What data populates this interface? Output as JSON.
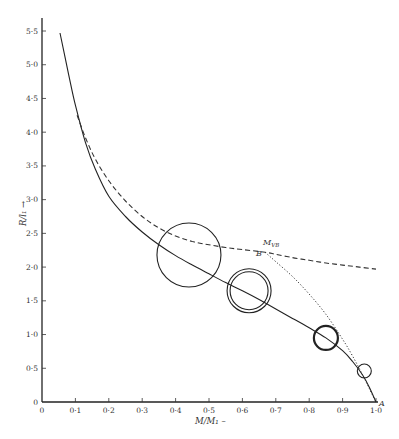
{
  "chart_data": {
    "type": "line",
    "title": "",
    "xlabel": "M/M₁ →",
    "ylabel": "R/l₁ →",
    "xlim": [
      0,
      1.0
    ],
    "ylim": [
      0,
      5.5
    ],
    "grid": false,
    "legend": null,
    "x_ticks": [
      "0",
      "0·1",
      "0·2",
      "0·3",
      "0·4",
      "0·5",
      "0·6",
      "0·7",
      "0·8",
      "0·9",
      "1·0"
    ],
    "y_ticks": [
      "0",
      "0·5",
      "1·0",
      "1·5",
      "2·0",
      "2·5",
      "3·0",
      "3·5",
      "4·0",
      "4·5",
      "5·0",
      "5·5"
    ],
    "series": [
      {
        "name": "solid curve",
        "style": "solid",
        "x": [
          0.054,
          0.08,
          0.1,
          0.13,
          0.16,
          0.2,
          0.25,
          0.3,
          0.35,
          0.4,
          0.45,
          0.5,
          0.55,
          0.6,
          0.65,
          0.7,
          0.75,
          0.8,
          0.85,
          0.9,
          0.93,
          0.96,
          0.98,
          1.0
        ],
        "y": [
          5.47,
          4.85,
          4.4,
          3.85,
          3.45,
          3.05,
          2.75,
          2.52,
          2.33,
          2.17,
          2.03,
          1.9,
          1.77,
          1.65,
          1.52,
          1.38,
          1.24,
          1.1,
          0.95,
          0.76,
          0.6,
          0.4,
          0.22,
          0.0
        ]
      },
      {
        "name": "dashed curve",
        "style": "dashed",
        "x": [
          0.105,
          0.13,
          0.16,
          0.2,
          0.25,
          0.3,
          0.35,
          0.4,
          0.45,
          0.5,
          0.55,
          0.6,
          0.668,
          0.7,
          0.75,
          0.8,
          0.85,
          0.9,
          0.95,
          1.0
        ],
        "y": [
          4.25,
          3.92,
          3.6,
          3.28,
          2.98,
          2.75,
          2.58,
          2.46,
          2.38,
          2.33,
          2.29,
          2.26,
          2.22,
          2.19,
          2.14,
          2.1,
          2.06,
          2.03,
          2.0,
          1.97
        ]
      },
      {
        "name": "dotted curve",
        "style": "dotted",
        "x": [
          0.668,
          0.7,
          0.75,
          0.8,
          0.85,
          0.9,
          0.93,
          0.96,
          0.98,
          1.0
        ],
        "y": [
          2.22,
          2.08,
          1.86,
          1.6,
          1.3,
          0.93,
          0.68,
          0.4,
          0.2,
          0.0
        ]
      }
    ],
    "circles": [
      {
        "cx": 0.44,
        "cy": 2.18,
        "r_px": 32,
        "style": "single-thin"
      },
      {
        "cx": 0.62,
        "cy": 1.65,
        "r_px": 22,
        "r_inner_px": 19,
        "style": "double"
      },
      {
        "cx": 0.85,
        "cy": 0.95,
        "r_px": 12,
        "style": "single-thick"
      },
      {
        "cx": 0.965,
        "cy": 0.46,
        "r_px": 7,
        "style": "single-thin"
      }
    ],
    "annotations": [
      {
        "text": "M",
        "sub": "VB",
        "x": 0.668,
        "y": 2.22,
        "position": "above"
      },
      {
        "text": "B",
        "x": 0.668,
        "y": 2.22,
        "position": "below-left"
      },
      {
        "text": "A",
        "x": 1.0,
        "y": 0.0,
        "position": "right"
      }
    ]
  },
  "labels": {
    "x_axis_title": "M/M₁ –",
    "y_axis_title": "R/l₁ →",
    "point_b": "B",
    "point_a": "A",
    "m_vb_main": "M",
    "m_vb_sub": "VB"
  }
}
